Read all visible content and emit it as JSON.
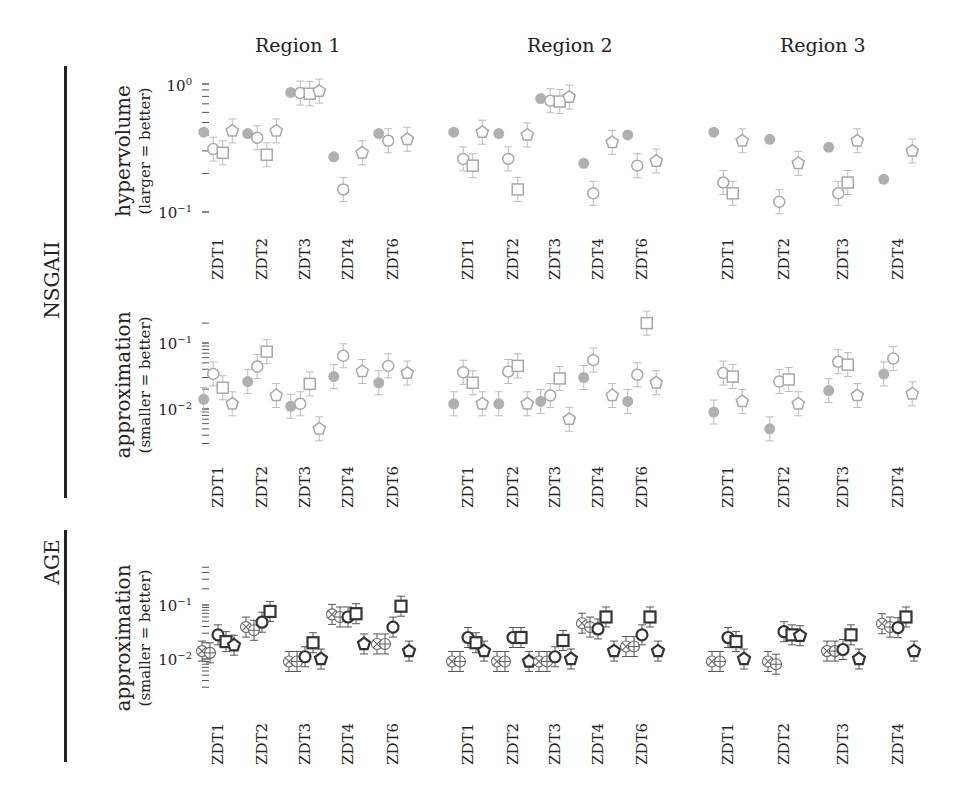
{
  "figure": {
    "regions": [
      "Region 1",
      "Region 2",
      "Region 3"
    ],
    "algorithms": [
      {
        "name": "NSGAII",
        "rows": [
          0,
          1
        ]
      },
      {
        "name": "AGE",
        "rows": [
          2
        ]
      }
    ],
    "rows": [
      {
        "metric": "hypervolume",
        "direction": "(larger = better)",
        "ticks": [
          "10^0",
          "10^-1"
        ]
      },
      {
        "metric": "approximation",
        "direction": "(smaller = better)",
        "ticks": [
          "10^-1",
          "10^-2"
        ]
      },
      {
        "metric": "approximation",
        "direction": "(smaller = better)",
        "ticks": [
          "10^-1",
          "10^-2"
        ]
      }
    ],
    "colors": {
      "gray_marker": "#a8a8a8",
      "gray_fill": "#b0b0b0",
      "dark_marker": "#333333",
      "text": "#222222"
    }
  },
  "chart_data": [
    {
      "type": "scatter",
      "title": "NSGAII hypervolume",
      "algorithm": "NSGAII",
      "ylabel": "hypervolume (larger = better)",
      "yscale": "log",
      "ylim": [
        0.1,
        1.0
      ],
      "yticks": [
        "10^0",
        "10^-1"
      ],
      "series_markers": [
        "filled-circle",
        "circle",
        "square",
        "pentagon"
      ],
      "panels": [
        {
          "region": "Region 1",
          "categories": [
            "ZDT1",
            "ZDT2",
            "ZDT3",
            "ZDT4",
            "ZDT6"
          ],
          "series": [
            {
              "name": "filled-circle",
              "values": [
                0.42,
                0.41,
                0.86,
                0.27,
                0.41
              ]
            },
            {
              "name": "circle",
              "values": [
                0.31,
                0.38,
                0.85,
                0.15,
                0.36
              ]
            },
            {
              "name": "square",
              "values": [
                0.29,
                0.28,
                0.84,
                null,
                null
              ]
            },
            {
              "name": "pentagon",
              "values": [
                0.43,
                0.43,
                0.88,
                0.29,
                0.37
              ]
            }
          ]
        },
        {
          "region": "Region 2",
          "categories": [
            "ZDT1",
            "ZDT2",
            "ZDT3",
            "ZDT4",
            "ZDT6"
          ],
          "series": [
            {
              "name": "filled-circle",
              "values": [
                0.42,
                0.41,
                0.77,
                0.24,
                0.4
              ]
            },
            {
              "name": "circle",
              "values": [
                0.26,
                0.26,
                0.74,
                0.14,
                0.23
              ]
            },
            {
              "name": "square",
              "values": [
                0.23,
                0.15,
                0.73,
                null,
                null
              ]
            },
            {
              "name": "pentagon",
              "values": [
                0.42,
                0.4,
                0.79,
                0.35,
                0.25
              ]
            }
          ]
        },
        {
          "region": "Region 3",
          "categories": [
            "ZDT1",
            "ZDT2",
            "ZDT3",
            "ZDT4"
          ],
          "series": [
            {
              "name": "filled-circle",
              "values": [
                0.42,
                0.37,
                0.32,
                0.18
              ]
            },
            {
              "name": "circle",
              "values": [
                0.17,
                0.12,
                0.14,
                null
              ]
            },
            {
              "name": "square",
              "values": [
                0.14,
                null,
                0.17,
                null
              ]
            },
            {
              "name": "pentagon",
              "values": [
                0.36,
                0.24,
                0.36,
                0.3
              ]
            }
          ]
        }
      ]
    },
    {
      "type": "scatter",
      "title": "NSGAII approximation",
      "algorithm": "NSGAII",
      "ylabel": "approximation (smaller = better)",
      "yscale": "log",
      "ylim": [
        0.004,
        0.25
      ],
      "yticks": [
        "10^-1",
        "10^-2"
      ],
      "series_markers": [
        "filled-circle",
        "circle",
        "square",
        "pentagon"
      ],
      "panels": [
        {
          "region": "Region 1",
          "categories": [
            "ZDT1",
            "ZDT2",
            "ZDT3",
            "ZDT4",
            "ZDT6"
          ],
          "series": [
            {
              "name": "filled-circle",
              "values": [
                0.014,
                0.026,
                0.011,
                0.031,
                0.025
              ]
            },
            {
              "name": "circle",
              "values": [
                0.034,
                0.044,
                0.012,
                0.064,
                0.045
              ]
            },
            {
              "name": "square",
              "values": [
                0.021,
                0.074,
                0.024,
                null,
                null
              ]
            },
            {
              "name": "pentagon",
              "values": [
                0.012,
                0.016,
                0.005,
                0.037,
                0.035
              ]
            }
          ]
        },
        {
          "region": "Region 2",
          "categories": [
            "ZDT1",
            "ZDT2",
            "ZDT3",
            "ZDT4",
            "ZDT6"
          ],
          "series": [
            {
              "name": "filled-circle",
              "values": [
                0.012,
                0.012,
                0.013,
                0.03,
                0.013
              ]
            },
            {
              "name": "circle",
              "values": [
                0.036,
                0.037,
                0.016,
                0.055,
                0.033
              ]
            },
            {
              "name": "square",
              "values": [
                0.025,
                0.045,
                0.029,
                null,
                0.2
              ]
            },
            {
              "name": "pentagon",
              "values": [
                0.012,
                0.012,
                0.007,
                0.016,
                0.025
              ]
            }
          ]
        },
        {
          "region": "Region 3",
          "categories": [
            "ZDT1",
            "ZDT2",
            "ZDT3",
            "ZDT4"
          ],
          "series": [
            {
              "name": "filled-circle",
              "values": [
                0.009,
                0.005,
                0.019,
                0.034
              ]
            },
            {
              "name": "circle",
              "values": [
                0.035,
                0.026,
                0.052,
                0.058
              ]
            },
            {
              "name": "square",
              "values": [
                0.031,
                0.028,
                0.047,
                null
              ]
            },
            {
              "name": "pentagon",
              "values": [
                0.013,
                0.012,
                0.016,
                0.017
              ]
            }
          ]
        }
      ]
    },
    {
      "type": "scatter",
      "title": "AGE approximation",
      "algorithm": "AGE",
      "ylabel": "approximation (smaller = better)",
      "yscale": "log",
      "ylim": [
        0.004,
        0.3
      ],
      "yticks": [
        "10^-1",
        "10^-2"
      ],
      "series_markers": [
        "circle-cross",
        "circle-plus",
        "circle",
        "square",
        "pentagon"
      ],
      "panels": [
        {
          "region": "Region 1",
          "categories": [
            "ZDT1",
            "ZDT2",
            "ZDT3",
            "ZDT4",
            "ZDT6"
          ],
          "series": [
            {
              "name": "circle-cross",
              "values": [
                0.014,
                0.039,
                0.009,
                0.067,
                0.019
              ]
            },
            {
              "name": "circle-plus",
              "values": [
                0.013,
                0.034,
                0.009,
                0.06,
                0.019
              ]
            },
            {
              "name": "circle",
              "values": [
                0.028,
                0.048,
                0.011,
                0.06,
                0.039
              ]
            },
            {
              "name": "square",
              "values": [
                0.021,
                0.076,
                0.02,
                0.069,
                0.095
              ]
            },
            {
              "name": "pentagon",
              "values": [
                0.018,
                null,
                0.01,
                0.019,
                0.014
              ]
            }
          ]
        },
        {
          "region": "Region 2",
          "categories": [
            "ZDT1",
            "ZDT2",
            "ZDT3",
            "ZDT4",
            "ZDT6"
          ],
          "series": [
            {
              "name": "circle-cross",
              "values": [
                0.009,
                0.009,
                0.009,
                0.046,
                0.017
              ]
            },
            {
              "name": "circle-plus",
              "values": [
                0.009,
                0.009,
                0.009,
                0.039,
                0.017
              ]
            },
            {
              "name": "circle",
              "values": [
                0.025,
                0.025,
                0.011,
                0.036,
                0.028
              ]
            },
            {
              "name": "square",
              "values": [
                0.02,
                0.025,
                0.022,
                0.06,
                0.06
              ]
            },
            {
              "name": "pentagon",
              "values": [
                0.014,
                0.009,
                0.01,
                0.014,
                0.014
              ]
            }
          ]
        },
        {
          "region": "Region 3",
          "categories": [
            "ZDT1",
            "ZDT2",
            "ZDT3",
            "ZDT4"
          ],
          "series": [
            {
              "name": "circle-cross",
              "values": [
                0.009,
                0.009,
                0.014,
                0.045
              ]
            },
            {
              "name": "circle-plus",
              "values": [
                0.009,
                0.008,
                0.014,
                0.039
              ]
            },
            {
              "name": "circle",
              "values": [
                0.025,
                0.032,
                0.015,
                0.038
              ]
            },
            {
              "name": "square",
              "values": [
                0.021,
                0.028,
                0.028,
                0.06
              ]
            },
            {
              "name": "pentagon",
              "values": [
                0.01,
                0.027,
                0.01,
                0.014
              ]
            }
          ]
        }
      ]
    }
  ]
}
